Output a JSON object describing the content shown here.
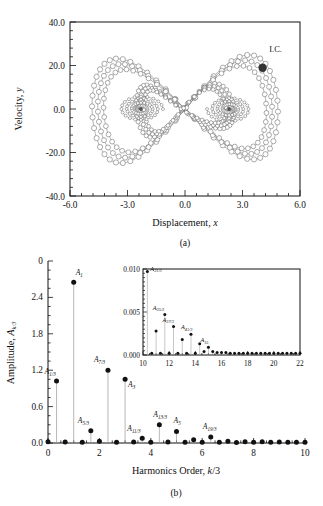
{
  "figure": {
    "panel_a_label": "(a)",
    "panel_b_label": "(b)"
  },
  "panel_a": {
    "xlabel_text": "Displacement, ",
    "xlabel_italic": "x",
    "ylabel_text": "Velocity, ",
    "ylabel_italic": "y",
    "xticks": [
      "-6.0",
      "-3.0",
      "0.0",
      "3.0",
      "6.0"
    ],
    "yticks": [
      "40.0",
      "20.0",
      "0.0",
      "-20.0",
      "-40.0"
    ],
    "annotation": "I.C.",
    "marker_style": "open-circle",
    "ic_marker_style": "filled-circle",
    "colors": {
      "axis": "#111111",
      "trace": "#555555",
      "ic": "#333333"
    }
  },
  "panel_b": {
    "xlabel_text": "Harmonics Order, ",
    "xlabel_italic": "k",
    "xlabel_tail": "/3",
    "ylabel_text": "Amplitude, ",
    "ylabel_italic": "A",
    "ylabel_sub": "k/3",
    "xticks": [
      "0",
      "2",
      "4",
      "6",
      "8",
      "10"
    ],
    "yticks": [
      "0",
      "2.4",
      "1.8",
      "1.2",
      "0.6",
      "0.0"
    ],
    "inset": {
      "xticks": [
        "10",
        "12",
        "14",
        "16",
        "18",
        "20",
        "22"
      ],
      "yticks": [
        "0.010",
        "0.005",
        "0.000"
      ]
    },
    "colors": {
      "axis": "#111111",
      "stem": "#888888",
      "marker": "#111111"
    }
  },
  "chart_data": [
    {
      "type": "line",
      "title": "(a) Phase portrait",
      "xlabel": "Displacement, x",
      "ylabel": "Velocity, y",
      "xlim": [
        -6.0,
        6.0
      ],
      "ylim": [
        -40.0,
        40.0
      ],
      "xticks": [
        -6.0,
        -3.0,
        0.0,
        3.0,
        6.0
      ],
      "yticks": [
        -40.0,
        -20.0,
        0.0,
        20.0,
        40.0
      ],
      "grid": false,
      "legend": "none",
      "annotations": [
        {
          "text": "I.C.",
          "x": 4.4,
          "y": 26.0
        },
        {
          "text": "initial-condition-marker",
          "x": 4.05,
          "y": 19.0
        }
      ],
      "description": "Closed figure-eight (double-lobe) periodic orbit traced with open-circle markers; outer large loops span x from about -4.8 to 4.9 and y from about -24 to 24, with two inner spiral clusters centred near x=-2.3 and x=2.3 at y=0."
    },
    {
      "type": "bar",
      "title": "(b) Harmonic amplitude spectrum",
      "xlabel": "Harmonics Order, k/3",
      "ylabel": "Amplitude, A_k/3",
      "xlim": [
        0,
        10
      ],
      "ylim": [
        0,
        3.0
      ],
      "xticks": [
        0,
        2,
        4,
        6,
        8,
        10
      ],
      "yticks": [
        0.0,
        0.6,
        1.2,
        1.8,
        2.4,
        3.0
      ],
      "grid": false,
      "legend": "none",
      "x": [
        0,
        0.333,
        0.667,
        1.0,
        1.333,
        1.667,
        2.0,
        2.333,
        2.667,
        3.0,
        3.333,
        3.667,
        4.0,
        4.333,
        4.667,
        5.0,
        5.333,
        5.667,
        6.0,
        6.333,
        6.667,
        7.0,
        7.333,
        7.667,
        8.0,
        8.333,
        8.667,
        9.0,
        9.333,
        9.667,
        10.0
      ],
      "values": [
        0.02,
        1.02,
        0.015,
        2.65,
        0.012,
        0.2,
        0.03,
        1.2,
        0.012,
        1.05,
        0.015,
        0.08,
        0.012,
        0.3,
        0.015,
        0.19,
        0.012,
        0.055,
        0.012,
        0.1,
        0.012,
        0.03,
        0.01,
        0.02,
        0.012,
        0.02,
        0.012,
        0.015,
        0.012,
        0.012,
        0.012
      ],
      "labelled_peaks": [
        {
          "label": "A",
          "sub": "1/3",
          "x": 0.333,
          "y": 1.02
        },
        {
          "label": "A",
          "sub": "1",
          "x": 1.0,
          "y": 2.65
        },
        {
          "label": "A",
          "sub": "5/3",
          "x": 1.667,
          "y": 0.2
        },
        {
          "label": "A",
          "sub": "7/3",
          "x": 2.333,
          "y": 1.2
        },
        {
          "label": "A",
          "sub": "3",
          "x": 3.0,
          "y": 1.05
        },
        {
          "label": "A",
          "sub": "11/3",
          "x": 3.667,
          "y": 0.08
        },
        {
          "label": "A",
          "sub": "13/3",
          "x": 4.333,
          "y": 0.3
        },
        {
          "label": "A",
          "sub": "5",
          "x": 5.0,
          "y": 0.19
        },
        {
          "label": "A",
          "sub": "19/3",
          "x": 6.333,
          "y": 0.1
        }
      ]
    },
    {
      "type": "bar",
      "title": "(b) inset — high-order harmonics",
      "xlabel": "",
      "ylabel": "",
      "xlim": [
        10,
        22
      ],
      "ylim": [
        0.0,
        0.01
      ],
      "xticks": [
        10,
        12,
        14,
        16,
        18,
        20,
        22
      ],
      "yticks": [
        0.0,
        0.005,
        0.01
      ],
      "grid": false,
      "legend": "none",
      "x": [
        10.333,
        10.667,
        11.0,
        11.333,
        11.667,
        12.0,
        12.333,
        12.667,
        13.0,
        13.333,
        13.667,
        14.0,
        14.333,
        14.667,
        15.0,
        15.333,
        15.667,
        16.0,
        16.333,
        16.667,
        17.0,
        17.333,
        17.667,
        18.0,
        18.333,
        18.667,
        19.0,
        19.333,
        19.667,
        20.0,
        20.333,
        20.667,
        21.0,
        21.333,
        21.667,
        22.0
      ],
      "values": [
        0.0097,
        0.0002,
        0.0028,
        0.0002,
        0.0047,
        0.0002,
        0.0033,
        0.0002,
        0.0018,
        0.0002,
        0.0024,
        0.0002,
        0.0013,
        0.0004,
        0.0009,
        0.0004,
        0.0003,
        0.0003,
        0.0003,
        0.0002,
        0.0002,
        0.0002,
        0.0002,
        0.0002,
        0.0002,
        0.0002,
        0.0002,
        0.0002,
        0.0002,
        0.0002,
        0.0002,
        0.0002,
        0.0002,
        0.0002,
        0.0002,
        0.0002
      ],
      "labelled_peaks": [
        {
          "label": "A",
          "sub": "31/3",
          "x": 10.333,
          "y": 0.0097
        },
        {
          "label": "A",
          "sub": "35/3",
          "x": 11.667,
          "y": 0.0047
        },
        {
          "label": "A",
          "sub": "37/3",
          "x": 12.333,
          "y": 0.0033
        },
        {
          "label": "A",
          "sub": "41/3",
          "x": 13.667,
          "y": 0.0024
        },
        {
          "label": "A",
          "sub": "15",
          "x": 15.0,
          "y": 0.0009
        }
      ]
    }
  ]
}
